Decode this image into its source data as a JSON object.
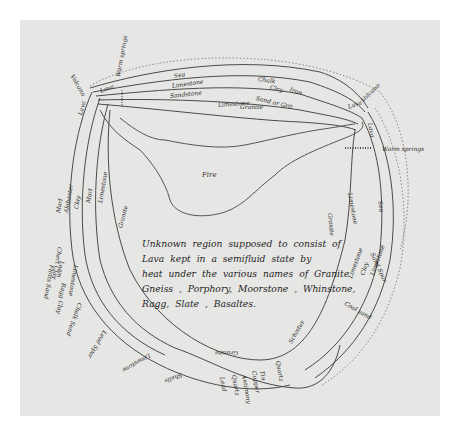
{
  "diagram": {
    "caption_lines": [
      "Unknown region supposed to consist of",
      "Lava kept in a semifluid state by",
      "heat under the various names of Granite",
      "Gneiss , Porphory, Moorstone , Whinstone,",
      "Ragg, Slate , Basaltes."
    ],
    "regions": {
      "granite_top": "Granite",
      "fire": "Fire",
      "granite_left": "Granite",
      "granite_right": "Granite"
    },
    "labels": {
      "sea_top": "Sea",
      "limestone_top": "Limestone",
      "sandstone": "Sandstone",
      "limestone_mid": "Limestone",
      "chalk": "Chalk",
      "clay_top": "Clay",
      "iron": "Iron",
      "sand_or_grit": "Sand or Grit",
      "lava_topleft": "Lava",
      "lava_left": "Lava",
      "warm_springs_top": "Warm springs",
      "volcano_left": "Volcano",
      "volcano_right": "Volcano",
      "lava_right_a": "Lava",
      "lava_right_b": "Lava",
      "warm_springs_right": "Warm springs",
      "limestone_right": "Limestone",
      "sea_right": "Sea",
      "sand_spar": "Sand Spar",
      "limestone_r2": "Limestone",
      "clay_r": "Clay",
      "limestone_r3": "Limestone",
      "coal_sand": "Coal sand",
      "marl": "Marl",
      "alabaster": "Alabaster",
      "clay_left": "Clay",
      "marl_left": "Marl",
      "limestone_left": "Limestone",
      "limestone_left2": "Limestone",
      "chert_clay": "Chert Clay",
      "loam": "Loam",
      "flints_sand": "Flints Sand",
      "ragg_clay": "Ragg Clay",
      "chalk_sand": "Chalk Sand",
      "lead_spar": "Lead Spar",
      "limestone_bottom": "Limestone",
      "granite_bottom": "Granite",
      "quartz": "Quartz",
      "tin": "Tin",
      "copper": "Copper",
      "antimony": "Antimony",
      "quartz2": "Quartz",
      "lead": "Lead",
      "schistus": "Schistus",
      "shells": "Shells"
    },
    "colors": {
      "paper": "#e6e6e4",
      "ink": "#3a3a3a",
      "border": "#ffffff"
    }
  }
}
